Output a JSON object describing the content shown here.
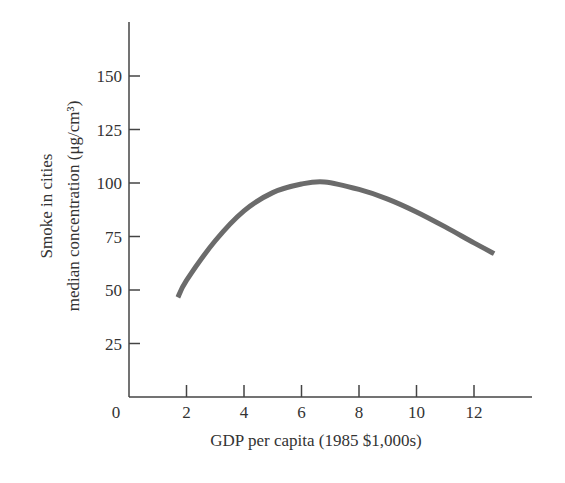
{
  "chart_data": {
    "type": "line",
    "title": "",
    "xlabel": "GDP per capita (1985 $1,000s)",
    "ylabel_line1": "Smoke in cities",
    "ylabel_line2": "median concentration (μg/cm³)",
    "xlim": [
      0,
      14
    ],
    "ylim": [
      0,
      170
    ],
    "x_ticks": [
      2,
      4,
      6,
      8,
      10,
      12
    ],
    "y_ticks": [
      25,
      50,
      75,
      100,
      125,
      150
    ],
    "origin_label": "0",
    "grid": false,
    "legend": null,
    "series": [
      {
        "name": "Smoke concentration",
        "color": "#6b6b6b",
        "x": [
          1.7,
          2,
          3,
          4,
          5,
          6,
          6.8,
          8,
          9,
          10,
          11,
          12,
          12.7
        ],
        "y": [
          46.5,
          54.5,
          73,
          87,
          95.5,
          99.5,
          100.5,
          97,
          92.5,
          86.5,
          79.5,
          72,
          67
        ]
      }
    ]
  }
}
